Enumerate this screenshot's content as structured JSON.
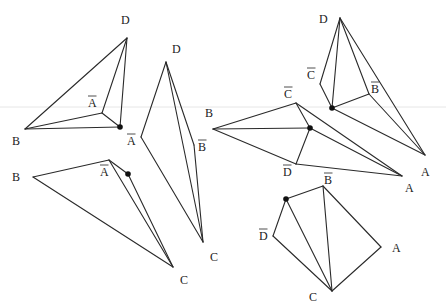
{
  "diagram": {
    "width": 446,
    "height": 306,
    "background": "#ffffff",
    "line_color": "#2a2a2a",
    "scanline": {
      "y": 107,
      "color": "#e6e6e6"
    },
    "figures": [
      {
        "id": "figure-1",
        "vertices": {
          "D": [
            127,
            38
          ],
          "B": [
            25,
            129
          ],
          "Abar": [
            102,
            113
          ],
          "P": [
            120,
            127
          ]
        },
        "edges": [
          [
            "D",
            "B"
          ],
          [
            "D",
            "Abar"
          ],
          [
            "D",
            "P"
          ],
          [
            "B",
            "Abar"
          ],
          [
            "B",
            "P"
          ],
          [
            "Abar",
            "P"
          ]
        ],
        "marked_point": "P",
        "labels": [
          {
            "text": "D",
            "x": 121,
            "y": 24,
            "bar": false
          },
          {
            "text": "A",
            "x": 88,
            "y": 107,
            "bar": true
          },
          {
            "text": "B",
            "x": 12,
            "y": 145,
            "bar": false
          }
        ]
      },
      {
        "id": "figure-2",
        "vertices": {
          "B": [
            33,
            177
          ],
          "Abar": [
            109,
            160
          ],
          "P": [
            128,
            174
          ],
          "C": [
            173,
            267
          ]
        },
        "edges": [
          [
            "B",
            "Abar"
          ],
          [
            "B",
            "C"
          ],
          [
            "Abar",
            "C"
          ],
          [
            "Abar",
            "P"
          ],
          [
            "P",
            "C"
          ]
        ],
        "marked_point": "P",
        "labels": [
          {
            "text": "B",
            "x": 12,
            "y": 181,
            "bar": false
          },
          {
            "text": "A",
            "x": 100,
            "y": 176,
            "bar": true
          },
          {
            "text": "C",
            "x": 180,
            "y": 284,
            "bar": false
          }
        ]
      },
      {
        "id": "figure-3",
        "vertices": {
          "D": [
            166,
            62
          ],
          "Abar": [
            141,
            137
          ],
          "Bbar": [
            194,
            145
          ],
          "C": [
            203,
            242
          ]
        },
        "edges": [
          [
            "D",
            "Abar"
          ],
          [
            "Abar",
            "C"
          ],
          [
            "D",
            "Bbar"
          ],
          [
            "Bbar",
            "C"
          ],
          [
            "D",
            "C"
          ]
        ],
        "marked_point": null,
        "labels": [
          {
            "text": "D",
            "x": 172,
            "y": 53,
            "bar": false
          },
          {
            "text": "A",
            "x": 127,
            "y": 145,
            "bar": true
          },
          {
            "text": "B",
            "x": 198,
            "y": 151,
            "bar": true
          },
          {
            "text": "C",
            "x": 210,
            "y": 261,
            "bar": false
          }
        ]
      },
      {
        "id": "figure-4",
        "vertices": {
          "B": [
            213,
            129
          ],
          "Cbar": [
            296,
            103
          ],
          "P": [
            310,
            128
          ],
          "Dbar": [
            296,
            164
          ],
          "A": [
            402,
            176
          ]
        },
        "edges": [
          [
            "B",
            "Cbar"
          ],
          [
            "Cbar",
            "A"
          ],
          [
            "B",
            "P"
          ],
          [
            "P",
            "A"
          ],
          [
            "B",
            "Dbar"
          ],
          [
            "Dbar",
            "A"
          ],
          [
            "P",
            "Dbar"
          ],
          [
            "Cbar",
            "P"
          ]
        ],
        "marked_point": "P",
        "labels": [
          {
            "text": "B",
            "x": 205,
            "y": 117,
            "bar": false
          },
          {
            "text": "C",
            "x": 284,
            "y": 98,
            "bar": true
          },
          {
            "text": "D",
            "x": 283,
            "y": 176,
            "bar": true
          },
          {
            "text": "A",
            "x": 405,
            "y": 192,
            "bar": false
          }
        ]
      },
      {
        "id": "figure-5",
        "vertices": {
          "D": [
            340,
            18
          ],
          "Cbar": [
            320,
            84
          ],
          "P": [
            332,
            108
          ],
          "Bbar": [
            369,
            94
          ],
          "A": [
            425,
            155
          ]
        },
        "edges": [
          [
            "D",
            "Cbar"
          ],
          [
            "Cbar",
            "P"
          ],
          [
            "D",
            "P"
          ],
          [
            "D",
            "Bbar"
          ],
          [
            "P",
            "Bbar"
          ],
          [
            "Bbar",
            "A"
          ],
          [
            "D",
            "A"
          ],
          [
            "P",
            "A"
          ]
        ],
        "marked_point": "P",
        "labels": [
          {
            "text": "D",
            "x": 319,
            "y": 23,
            "bar": false
          },
          {
            "text": "C",
            "x": 307,
            "y": 79,
            "bar": true
          },
          {
            "text": "B",
            "x": 371,
            "y": 93,
            "bar": true
          },
          {
            "text": "A",
            "x": 421,
            "y": 176,
            "bar": false
          }
        ]
      },
      {
        "id": "figure-6",
        "vertices": {
          "P": [
            286,
            199
          ],
          "Bbar": [
            323,
            186
          ],
          "Dbar": [
            273,
            236
          ],
          "A": [
            381,
            247
          ],
          "C": [
            332,
            291
          ]
        },
        "edges": [
          [
            "P",
            "Bbar"
          ],
          [
            "P",
            "Dbar"
          ],
          [
            "Dbar",
            "C"
          ],
          [
            "P",
            "C"
          ],
          [
            "Bbar",
            "C"
          ],
          [
            "Bbar",
            "A"
          ],
          [
            "A",
            "C"
          ]
        ],
        "marked_point": "P",
        "labels": [
          {
            "text": "B",
            "x": 324,
            "y": 184,
            "bar": true
          },
          {
            "text": "D",
            "x": 259,
            "y": 240,
            "bar": true
          },
          {
            "text": "A",
            "x": 392,
            "y": 252,
            "bar": false
          },
          {
            "text": "C",
            "x": 309,
            "y": 301,
            "bar": false
          }
        ]
      }
    ]
  }
}
